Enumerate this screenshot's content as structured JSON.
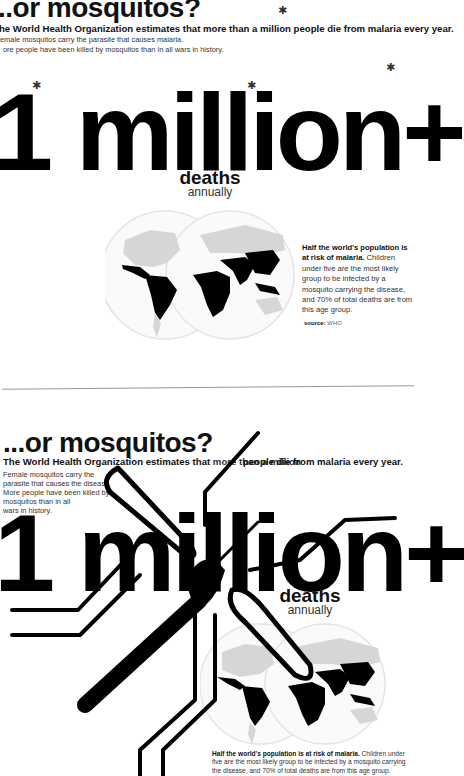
{
  "top_panel": {
    "headline": "..or mosquitos?",
    "lead": "he World Health Organization estimates that more than a million people die from malaria every year.",
    "body_lines": [
      "emale mosquitos carry the parasite that causes malaria.",
      "ore people have been killed by mosquitos than in all wars in history."
    ],
    "big_number": "1 million+",
    "deaths_label": "deaths",
    "annually_label": "annually",
    "note_bold": "Half the world's population is at risk of malaria.",
    "note_text": " Children under five are the most likely group to be infected by a mosquito carrying the disease, and 70% of total deaths are from this age group.",
    "source_label": "source:",
    "source_value": "WHO",
    "mosquito_icon": "mosquito-icon"
  },
  "bottom_panel": {
    "headline": "...or mosquitos?",
    "lead_bold": "The World Health Organization estimates that",
    "lead_light": " more than a million",
    "lead_tail": "people die from malaria every year.",
    "body_lines": [
      "Female mosquitos carry the",
      "parasite that causes the disease.",
      "More people have been killed by",
      "mosquitos than in all",
      "wars in history."
    ],
    "big_number": "1 million+",
    "deaths_label": "deaths",
    "annually_label": "annually",
    "note_bold": "Half the world's population is at risk of malaria.",
    "note_text": " Children under five are the most likely group to be infected by a mosquito carrying the disease, and 70% of total deaths are from this age group."
  },
  "colors": {
    "ink": "#000000",
    "map_risk": "#000000",
    "map_land": "#d6d6d6",
    "globe_outline": "#e4e4e4",
    "divider": "#999999"
  }
}
